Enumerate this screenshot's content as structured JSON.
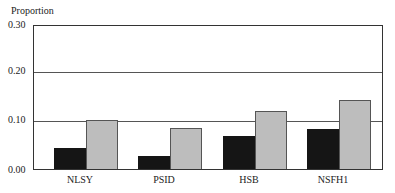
{
  "chart_data": {
    "type": "bar",
    "title": "",
    "xlabel": "",
    "ylabel": "Proportion",
    "ylim": [
      0,
      0.3
    ],
    "yticks": [
      "0.00",
      "0.10",
      "0.20",
      "0.30"
    ],
    "grid": true,
    "legend": null,
    "categories": [
      "NLSY",
      "PSID",
      "HSB",
      "NSFH1"
    ],
    "series": [
      {
        "name": "Series 1 (black)",
        "color": "#151515",
        "values": [
          0.045,
          0.027,
          0.07,
          0.083
        ]
      },
      {
        "name": "Series 2 (gray)",
        "color": "#bdbdbd",
        "values": [
          0.103,
          0.087,
          0.122,
          0.145
        ]
      }
    ]
  }
}
